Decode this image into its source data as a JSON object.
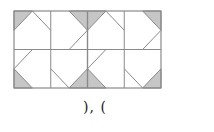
{
  "figure": {
    "grid": {
      "x": 14,
      "y": 11,
      "width": 147,
      "height": 77,
      "cols": 4,
      "rows": 2,
      "line_color": "#8a8a8a",
      "shade_color": "#c6c6c6"
    },
    "cells": [
      {
        "row": 0,
        "col": 0,
        "shaded_corner": "top-left",
        "diagonal": "top-mid-to-right-mid"
      },
      {
        "row": 0,
        "col": 1,
        "shaded_corner": "top-right",
        "diagonal": "right-mid-to-bottom-mid"
      },
      {
        "row": 0,
        "col": 2,
        "shaded_corner": "top-left",
        "diagonal": "top-mid-to-right-mid"
      },
      {
        "row": 0,
        "col": 3,
        "shaded_corner": "top-right",
        "diagonal": "right-mid-to-bottom-mid"
      },
      {
        "row": 1,
        "col": 0,
        "shaded_corner": "bottom-left",
        "diagonal": "top-mid-to-left-mid"
      },
      {
        "row": 1,
        "col": 1,
        "shaded_corner": "bottom-right",
        "diagonal": "left-mid-to-bottom-mid"
      },
      {
        "row": 1,
        "col": 2,
        "shaded_corner": "bottom-left",
        "diagonal": "top-mid-to-left-mid"
      },
      {
        "row": 1,
        "col": 3,
        "shaded_corner": "bottom-right",
        "diagonal": "left-mid-to-bottom-mid"
      }
    ]
  },
  "caption": {
    "text": "), ("
  }
}
